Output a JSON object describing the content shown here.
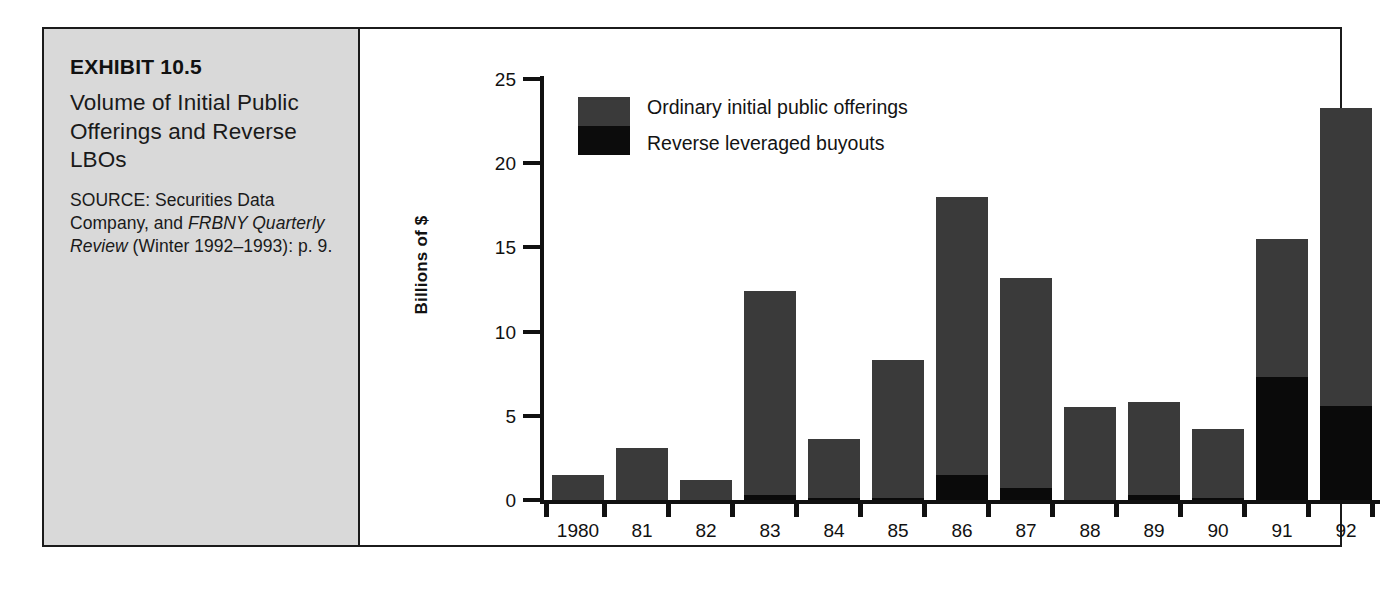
{
  "exhibit": {
    "number": "EXHIBIT 10.5",
    "title": "Volume of Initial Public Offerings and Reverse LBOs",
    "source_prefix": "SOURCE: Securities Data Company, and ",
    "source_italic": "FRBNY Quarterly Review",
    "source_suffix": " (Winter 1992–1993): p. 9."
  },
  "legend": {
    "items": [
      {
        "label": "Ordinary initial public offerings",
        "color": "#3a3a3a",
        "name": "ordinary-ipo"
      },
      {
        "label": "Reverse leveraged buyouts",
        "color": "#0c0c0c",
        "name": "reverse-lbo"
      }
    ]
  },
  "chart_data": {
    "type": "bar",
    "subtype": "stacked",
    "title": "Volume of Initial Public Offerings and Reverse LBOs",
    "xlabel": "",
    "ylabel": "Billions of $",
    "ylim": [
      0,
      25
    ],
    "yticks": [
      0,
      5,
      10,
      15,
      20,
      25
    ],
    "ytick_labels": [
      "0",
      "5",
      "10",
      "15",
      "20",
      "25"
    ],
    "grid": false,
    "legend_position": "top-left-inside",
    "categories": [
      "1980",
      "81",
      "82",
      "83",
      "84",
      "85",
      "86",
      "87",
      "88",
      "89",
      "90",
      "91",
      "92"
    ],
    "series": [
      {
        "name": "Reverse leveraged buyouts",
        "color": "#0c0c0c",
        "values": [
          0.0,
          0.0,
          0.0,
          0.3,
          0.1,
          0.1,
          1.5,
          0.7,
          0.0,
          0.3,
          0.1,
          7.3,
          5.6
        ]
      },
      {
        "name": "Ordinary initial public offerings",
        "color": "#3a3a3a",
        "values": [
          1.5,
          3.1,
          1.2,
          12.1,
          3.5,
          8.2,
          16.5,
          12.5,
          5.5,
          5.5,
          4.1,
          8.2,
          17.7
        ]
      }
    ],
    "totals": [
      1.5,
      3.1,
      1.2,
      12.4,
      3.6,
      8.3,
      18.0,
      13.2,
      5.5,
      5.8,
      4.2,
      15.5,
      23.3
    ]
  },
  "colors": {
    "panel_background": "#d9d9d9",
    "frame": "#1b1b1b",
    "ipo_gray": "#3a3a3a",
    "lbo_black": "#0c0c0c",
    "text": "#111111"
  }
}
